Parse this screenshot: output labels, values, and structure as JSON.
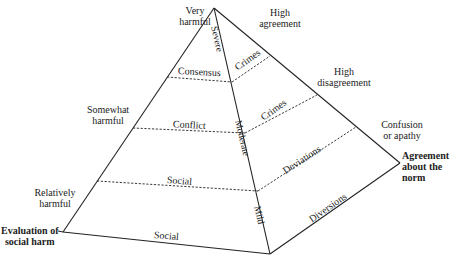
{
  "diagram": {
    "type": "pyramid",
    "axes": {
      "left_axis_title": "Evaluation of social harm",
      "right_axis_title": "Agreement about the norm",
      "left_axis_levels": [
        "Very harmful",
        "Somewhat harmful",
        "Relatively harmful"
      ],
      "right_axis_levels": [
        "High agreement",
        "High disagreement",
        "Confusion or apathy"
      ],
      "spine_levels": [
        "Severe",
        "Moderate",
        "Mild"
      ]
    },
    "left_face": {
      "bands": [
        "Consensus",
        "Conflict",
        "Social",
        "Social"
      ]
    },
    "right_face": {
      "bands": [
        "Crimes",
        "Crimes",
        "Deviations",
        "Diversions"
      ]
    },
    "labels": {
      "very": "Very",
      "harmful": "harmful",
      "somewhat": "Somewhat",
      "relatively": "Relatively",
      "high": "High",
      "agreement": "agreement",
      "disagreement": "disagreement",
      "confusion": "Confusion",
      "or_apathy": "or apathy",
      "eval_line1": "Evaluation of",
      "eval_line2": "social harm",
      "agree_line1": "Agreement",
      "agree_line2": "about the",
      "agree_line3": "norm",
      "severe": "Severe",
      "moderate": "Moderate",
      "mild": "Mild",
      "consensus": "Consensus",
      "conflict": "Conflict",
      "social_upper": "Social",
      "social_lower": "Social",
      "crimes_upper": "Crimes",
      "crimes_lower": "Crimes",
      "deviations": "Deviations",
      "diversions": "Diversions"
    }
  }
}
